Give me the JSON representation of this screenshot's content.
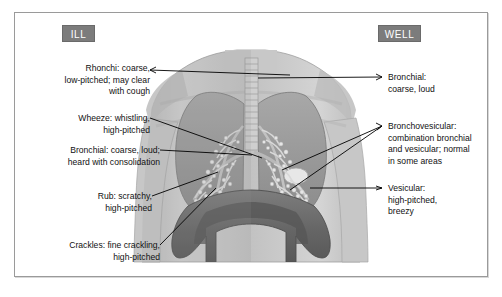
{
  "figure": {
    "background_color": "#ffffff",
    "frame_color": "#9a9a9a",
    "badge_color": "#7c7c7c",
    "badge_text_color": "#ffffff",
    "leader_color": "#000000"
  },
  "badges": {
    "ill": "ILL",
    "well": "WELL"
  },
  "labels_left": [
    {
      "name": "rhonchi",
      "text": "Rhonchi: coarse,\nlow-pitched; may clear\nwith cough"
    },
    {
      "name": "wheeze",
      "text": "Wheeze: whistling,\nhigh-pitched"
    },
    {
      "name": "bronchial",
      "text": "Bronchial: coarse, loud;\nheard with consolidation"
    },
    {
      "name": "rub",
      "text": "Rub: scratchy,\nhigh-pitched"
    },
    {
      "name": "crackles",
      "text": "Crackles: fine crackling,\nhigh-pitched"
    }
  ],
  "labels_right": [
    {
      "name": "bronchial",
      "text": "Bronchial:\ncoarse, loud"
    },
    {
      "name": "bronchovesicular",
      "text": "Bronchovesicular:\ncombination bronchial\nand vesicular; normal\nin some areas"
    },
    {
      "name": "vesicular",
      "text": "Vesicular:\nhigh-pitched,\nbreezy"
    }
  ],
  "artwork": {
    "description": "anterior view of human torso showing trachea, bronchial tree, both lungs and diaphragm, left half shaded as ill, right half as well",
    "skin_tone": "#c9c9c9",
    "lung_tone": "#9d9d9d",
    "bronchi_tone": "#ededed",
    "diaphragm_tone": "#6f6f6f"
  }
}
